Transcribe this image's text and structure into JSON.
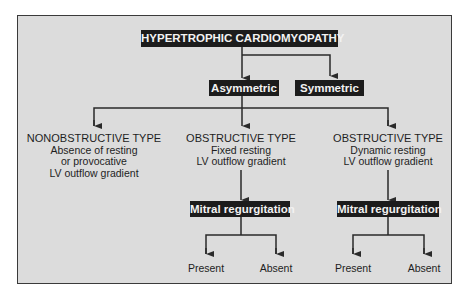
{
  "title": "HYPERTROPHIC CARDIOMYOPATHY",
  "level1": [
    {
      "label": "Asymmetric"
    },
    {
      "label": "Symmetric"
    }
  ],
  "types": [
    {
      "heading": "NONOBSTRUCTIVE TYPE",
      "lines": [
        "Absence of resting",
        "or provocative",
        "LV outflow gradient"
      ]
    },
    {
      "heading": "OBSTRUCTIVE TYPE",
      "lines": [
        "Fixed resting",
        "LV outflow gradient"
      ]
    },
    {
      "heading": "OBSTRUCTIVE TYPE",
      "lines": [
        "Dynamic resting",
        "LV outflow gradient"
      ]
    }
  ],
  "mitral": [
    {
      "label": "Mitral regurgitation",
      "outcomes": [
        "Present",
        "Absent"
      ]
    },
    {
      "label": "Mitral regurgitation",
      "outcomes": [
        "Present",
        "Absent"
      ]
    }
  ],
  "colors": {
    "background": "#dcdcdc",
    "box": "#1c1c1c",
    "line": "#2a2a2a"
  }
}
